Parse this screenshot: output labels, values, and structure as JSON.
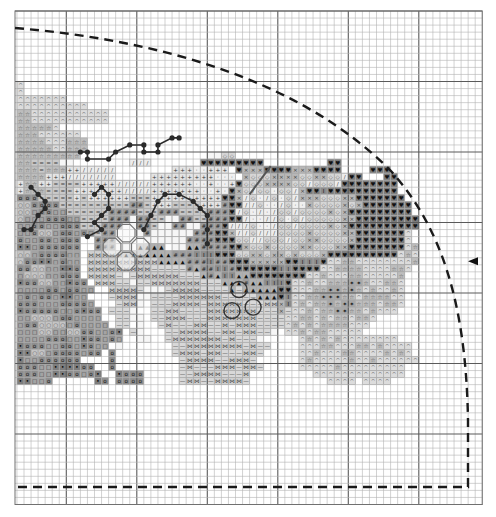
{
  "grid": {
    "columns": 66,
    "rows": 70,
    "major_every": 10,
    "first_major_column": 7,
    "first_major_row": 10
  },
  "center_arrow": {
    "direction": "left",
    "row": 35
  },
  "cut_line": {
    "style": "dashed",
    "shape": "quarter-round corner"
  },
  "legend_tones": {
    "^": {
      "name": "caret",
      "glyph": "^",
      "fill": "#dcdcdc",
      "ink": "#555555"
    },
    "*": {
      "name": "star",
      "glyph": "☆",
      "fill": "#bdbdbd",
      "ink": "#444444"
    },
    "o": {
      "name": "circle",
      "glyph": "o",
      "fill": "#8e8e8e",
      "ink": "#111111"
    },
    "s": {
      "name": "square",
      "glyph": "□",
      "fill": "#a3a3a3",
      "ink": "#333333"
    },
    "O": {
      "name": "ring",
      "glyph": "○",
      "fill": "#c4c4c4",
      "ink": "#555555"
    },
    "k": {
      "name": "dark-dot",
      "glyph": "•",
      "fill": "#7d7d7d",
      "ink": "#000000"
    },
    "+": {
      "name": "plus",
      "glyph": "+",
      "fill": "#e4e4e4",
      "ink": "#333333"
    },
    "/": {
      "name": "slash",
      "glyph": "/",
      "fill": "#ececec",
      "ink": "#444444"
    },
    "=": {
      "name": "equals",
      "glyph": "=",
      "fill": "#c9c9c9",
      "ink": "#444444"
    },
    "#": {
      "name": "hash",
      "glyph": "#",
      "fill": "#9a9a9a",
      "ink": "#222222"
    },
    "h": {
      "name": "heart",
      "glyph": "♥",
      "fill": "#7a7a7a",
      "ink": "#111111"
    },
    "x": {
      "name": "cross",
      "glyph": "×",
      "fill": "#b8b8b8",
      "ink": "#333333"
    },
    "d": {
      "name": "diamond",
      "glyph": "◇",
      "fill": "#d6d6d6",
      "ink": "#555555"
    },
    "b": {
      "name": "bowtie",
      "glyph": "⋈",
      "fill": "#d0d0d0",
      "ink": "#444444"
    },
    "a": {
      "name": "triangle",
      "glyph": "▲",
      "fill": "#b0b0b0",
      "ink": "#111111"
    },
    "i": {
      "name": "ibeam",
      "glyph": "I",
      "fill": "#8c8c8c",
      "ink": "#111111"
    },
    "-": {
      "name": "dash",
      "glyph": "—",
      "fill": "#d8d8d8",
      "ink": "#555555"
    },
    "p": {
      "name": "dot",
      "glyph": "·",
      "fill": "#f0f0f0",
      "ink": "#222222"
    },
    "f": {
      "name": "flower-dark",
      "glyph": "✦",
      "fill": "#a8a8a8",
      "ink": "#222222"
    },
    "w": {
      "name": "white",
      "glyph": "",
      "fill": "#f6f6f6",
      "ink": "#666666"
    }
  },
  "pattern_rows": [
    "",
    "",
    "",
    "",
    "",
    "",
    "",
    "",
    "",
    "",
    "^",
    "^",
    "^^^^^^^",
    "^^^^^^^^^^",
    "**^^^^^^^^^^^",
    "**^^^^^^^^^^^",
    "*****^",
    "***^^^^^^",
    "****^^^***",
    "*****^^***",
    "*********..................wwdd",
    "**====ww........///.......hhhhhhhhh.........hh",
    "***=***++/////........+++pp+++.hxxxhhhhxxxhhhh....hhh",
    "****+++///////.....+++++++++ppp.xdddxxxxddxxdd/hh...hh",
    "+**++====+++++/////++++++pp+pp+hdddxxxxdd/ddd/hhhhhhhh",
    "+***====+++++++////+++++++pp+phxd/ddpdd/xhhihhhhhhhhhh",
    "ooo=====+=++++++===++++++++++hhx/dp/dpd/xxxdddxxhhhhhhh",
    "OOoooo==========##=+++====+++#hh//dpp/dppxddddxdxhhhhhhh",
    "OOsooss======####===###====###h/dp/p/dd/ddddxdxhhhhhhhhh",
    "Osssoooss====###w##==ww##==###hh/pp//dpd/dddddxxhhhhhhhhh",
    "ssoossooo===###ww##=ww##ww###h///dpp/dd/ddddxdxhhhhhhhhhh",
    "ssoOOsoosos=##wwww#wwwwww###hhx//d///ddddxddddxxhhhhhhh^",
    "ossoosooo..###wwwwwwwwww####hhhdd//ddd/ddxxddddxhhhhhhh^",
    "kksoooooo..###wwwaaaa.wwaa####hhxddxddddxxdddxxhhhhhhhh^*",
    "OOsooooss.bbbbbaaaaaaa###iiihhhddxxdxxdxdddxhhhhhhhhhh^*^",
    "Oookksoss.bbbbbbbbbbaaaa###i##hhhxxxxxhhiiih^^**^^^^^^^^*",
    "ooOOsskko.bbbbbbbbb-----#a##ii#hhhhhhiihhhh^^****^^^^**^",
    "sOOOssooo.bbbb-w-bbbbbb---a#aiiaahhhhhhhh^^*^^^**^^^^^*",
    "kooOOsskoo.bbb--w--bbbbbbb---aaa#aaiiih^^*^^***ff*^^**^",
    "ssssoosooss..bbbb-www-bbbb----a-aaaaahh^^^**ff*f*^*^^*^",
    "sosooskkss...-bbbww----bbbbbb-----aaahi^^**fff**^****^^",
    "ooosssoooos...-bbw.---bbbb-bbbbb---bbxi^*^**f*ff***^**^",
    "kooooossokoo.---w..--bb----bbbbbbb---x-^^*^**ff**^*^^^",
    "ssOOOsoossss..--ww.--bbb---bbbbbbb----^^**^*^**^**^",
    "sooOOOOsossss.--.w..-b---bb--b-bbb----^*^*^****^^^",
    "sssOOssOOoossok.-w...--bbbb--bb-bb--w.^^*^**^^^^^",
    "ssssooosskoosos..ww..-bbbbbbb-b---w.....^*^*^*^^^^^^^^",
    "kooossooskoss.w.......--bbbbbbbb-b--....^^^**^^^**^*^^^^",
    "kkOOsoooosoo.o........-bbb-bb---bb-.....^^*^^^**^^^^*^*^",
    "kssoooooo....o.........-bbbb--bbb-......^*^^^^^*^^*^^^^^^",
    "ooosskkkkoo..o.........-b---bbb-bb-.....^^^^^*^^^^^^^^^",
    "ooosskkoosok..kooo.....--bbbb---b.........^^^^^^^^^^^^^",
    "kksso......ko.oooo.....-bb--bbbb-...........^^^^.^^^^",
    "",
    "",
    "",
    "",
    "",
    "",
    "",
    "",
    "",
    "",
    "",
    "",
    "",
    "",
    "",
    "",
    "",
    ""
  ],
  "extra_marks": {
    "bead_outlines": 3,
    "flower_rosettes": 4,
    "berry_rings": 3
  }
}
